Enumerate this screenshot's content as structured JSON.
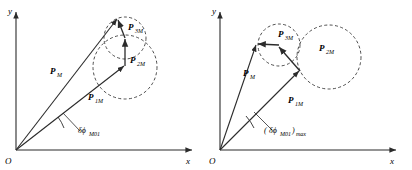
{
  "figure": {
    "background_color": "#ffffff",
    "stroke_color": "#2b2b2b",
    "dash_color": "#3a3a3a"
  },
  "panels": [
    {
      "id": "left",
      "axes": {
        "y_label": "y",
        "x_label": "x",
        "origin_label": "O"
      },
      "vectors": [
        {
          "name": "P_M",
          "label": "P",
          "sub": "M",
          "label_x": 50,
          "label_y": 74
        },
        {
          "name": "P_1M",
          "label": "P",
          "sub": "1M",
          "label_x": 88,
          "label_y": 100
        },
        {
          "name": "P_2M",
          "label": "P",
          "sub": "2M",
          "label_x": 130,
          "label_y": 63
        },
        {
          "name": "P_3M",
          "label": "P",
          "sub": "3M",
          "label_x": 128,
          "label_y": 30
        }
      ],
      "angle_label": {
        "text": "δϕ",
        "sub": "M01",
        "prefix": "",
        "suffix": "",
        "x": 78,
        "y": 133
      }
    },
    {
      "id": "right",
      "axes": {
        "y_label": "y",
        "x_label": "x",
        "origin_label": "O"
      },
      "vectors": [
        {
          "name": "P_M",
          "label": "P",
          "sub": "M",
          "label_x": 37,
          "label_y": 76
        },
        {
          "name": "P_1M",
          "label": "P",
          "sub": "1M",
          "label_x": 82,
          "label_y": 103
        },
        {
          "name": "P_2M",
          "label": "P",
          "sub": "2M",
          "label_x": 113,
          "label_y": 51
        },
        {
          "name": "P_3M",
          "label": "P",
          "sub": "3M",
          "label_x": 72,
          "label_y": 37
        }
      ],
      "angle_label": {
        "text": "δϕ",
        "sub": "M01",
        "prefix": "(",
        "suffix": ")",
        "outer_sub": "max",
        "x": 62,
        "y": 133
      }
    }
  ]
}
